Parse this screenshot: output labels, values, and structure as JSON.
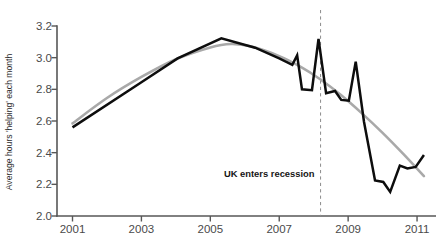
{
  "chart_data": {
    "type": "line",
    "title": "",
    "xlabel": "",
    "ylabel": "Average hours 'helping' each month",
    "xlim": [
      2000.55,
      2011.55
    ],
    "ylim": [
      2.0,
      3.2
    ],
    "grid": false,
    "legend": "none",
    "x_ticks": [
      2001,
      2003,
      2005,
      2007,
      2009,
      2011
    ],
    "x_tick_labels": [
      "2001",
      "2003",
      "2005",
      "2007",
      "2009",
      "2011"
    ],
    "y_ticks": [
      2.0,
      2.2,
      2.4,
      2.6,
      2.8,
      3.0,
      3.2
    ],
    "y_tick_labels": [
      "2.0",
      "2.2",
      "2.4",
      "2.6",
      "2.8",
      "3.0",
      "3.2"
    ],
    "annotations": [
      {
        "text": "UK enters recession",
        "x": 2008.2,
        "kind": "vertical-dashed-line-with-label",
        "label_align": "right"
      }
    ],
    "series": [
      {
        "name": "Average hours helping each month (actual)",
        "color": "#0d0d0d",
        "style": "solid",
        "points": [
          [
            2001.0,
            2.56
          ],
          [
            2003.0,
            2.845
          ],
          [
            2004.05,
            2.995
          ],
          [
            2005.32,
            3.122
          ],
          [
            2006.3,
            3.063
          ],
          [
            2007.0,
            2.995
          ],
          [
            2007.38,
            2.955
          ],
          [
            2007.52,
            3.015
          ],
          [
            2007.66,
            2.8
          ],
          [
            2007.95,
            2.795
          ],
          [
            2008.14,
            3.118
          ],
          [
            2008.36,
            2.775
          ],
          [
            2008.62,
            2.79
          ],
          [
            2008.8,
            2.733
          ],
          [
            2009.02,
            2.728
          ],
          [
            2009.22,
            2.975
          ],
          [
            2009.46,
            2.595
          ],
          [
            2009.78,
            2.225
          ],
          [
            2010.02,
            2.215
          ],
          [
            2010.22,
            2.152
          ],
          [
            2010.5,
            2.318
          ],
          [
            2010.72,
            2.3
          ],
          [
            2010.96,
            2.31
          ],
          [
            2011.2,
            2.385
          ]
        ]
      },
      {
        "name": "Smoothed trend",
        "color": "#a9a9a9",
        "style": "solid-smoothed",
        "points": [
          [
            2001.0,
            2.585
          ],
          [
            2002.0,
            2.745
          ],
          [
            2003.0,
            2.878
          ],
          [
            2004.0,
            2.99
          ],
          [
            2005.0,
            3.065
          ],
          [
            2005.6,
            3.086
          ],
          [
            2006.2,
            3.07
          ],
          [
            2007.0,
            3.01
          ],
          [
            2007.6,
            2.945
          ],
          [
            2008.2,
            2.862
          ],
          [
            2008.8,
            2.762
          ],
          [
            2009.4,
            2.648
          ],
          [
            2010.0,
            2.525
          ],
          [
            2010.6,
            2.392
          ],
          [
            2011.2,
            2.252
          ]
        ]
      }
    ]
  },
  "caption": {
    "text": ""
  }
}
